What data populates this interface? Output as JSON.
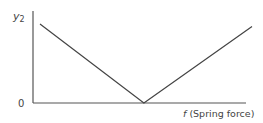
{
  "chart_data": {
    "type": "line",
    "title": "",
    "xlabel": "f (Spring force)",
    "xlabel_italic_part": "f",
    "xlabel_rest": " (Spring force)",
    "ylabel": "y2",
    "ylabel_base": "y",
    "ylabel_sub": "2",
    "y_tick_labels": [
      "0"
    ],
    "grid": false,
    "legend": null,
    "series": [
      {
        "name": "y2 vs f",
        "points": [
          {
            "x": 0.0,
            "y": 0.86
          },
          {
            "x": 0.49,
            "y": 0.0
          },
          {
            "x": 1.0,
            "y": 0.83
          }
        ]
      }
    ],
    "xlim": [
      0,
      1
    ],
    "ylim": [
      0,
      1
    ],
    "colors": {
      "line": "#444444",
      "axis": "#555555",
      "text": "#444444"
    }
  }
}
